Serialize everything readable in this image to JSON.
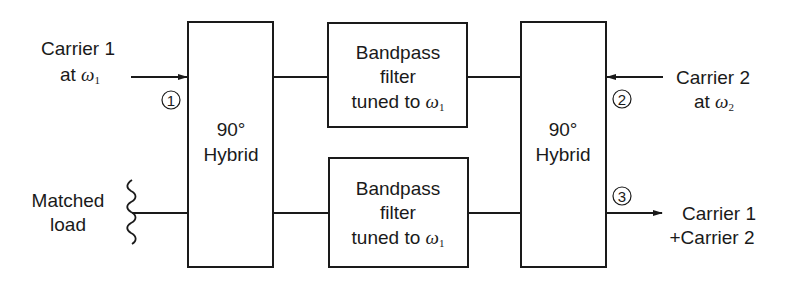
{
  "diagram": {
    "type": "block-diagram",
    "blocks": {
      "hybrid_left": {
        "line1": "90°",
        "line2": "Hybrid"
      },
      "hybrid_right": {
        "line1": "90°",
        "line2": "Hybrid"
      },
      "filter_top": {
        "line1": "Bandpass",
        "line2": "filter",
        "line3_prefix": "tuned to ",
        "line3_symbol": "ω",
        "line3_sub": "1"
      },
      "filter_bottom": {
        "line1": "Bandpass",
        "line2": "filter",
        "line3_prefix": "tuned to ",
        "line3_symbol": "ω",
        "line3_sub": "1"
      }
    },
    "inputs": {
      "carrier1": {
        "line1": "Carrier 1",
        "line2_prefix": "at ",
        "line2_symbol": "ω",
        "line2_sub": "1"
      },
      "carrier2": {
        "line1": "Carrier 2",
        "line2_prefix": "at ",
        "line2_symbol": "ω",
        "line2_sub": "2"
      },
      "matched_load": {
        "line1": "Matched",
        "line2": "load"
      }
    },
    "outputs": {
      "combined": {
        "line1": "Carrier 1",
        "line2": "+Carrier 2"
      }
    },
    "ports": {
      "port1": "1",
      "port2": "2",
      "port3": "3"
    },
    "colors": {
      "line": "#1a1a1a",
      "background": "#ffffff"
    }
  }
}
